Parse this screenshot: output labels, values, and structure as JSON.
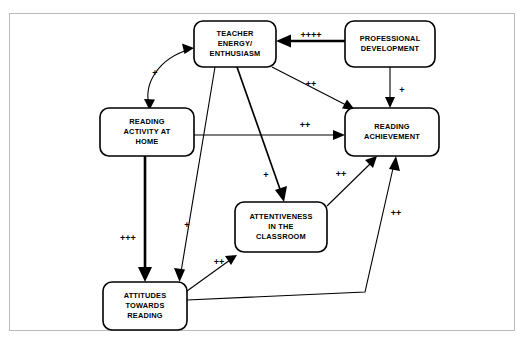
{
  "figure": {
    "clipped_header_fragment": "",
    "nodes": [
      {
        "id": "teacher-energy",
        "lines": [
          "TEACHER",
          "ENERGY/",
          "ENTHUSIASM"
        ],
        "x": 194,
        "y": 21,
        "w": 82,
        "h": 46
      },
      {
        "id": "professional-development",
        "lines": [
          "PROFESSIONAL",
          "DEVELOPMENT"
        ],
        "x": 345,
        "y": 21,
        "w": 90,
        "h": 46
      },
      {
        "id": "reading-activity-at-home",
        "lines": [
          "READING",
          "ACTIVITY AT",
          "HOME"
        ],
        "x": 100,
        "y": 108,
        "w": 94,
        "h": 48
      },
      {
        "id": "reading-achievement",
        "lines": [
          "READING",
          "ACHIEVEMENT"
        ],
        "x": 345,
        "y": 108,
        "w": 94,
        "h": 48
      },
      {
        "id": "attentiveness-in-the-classroom",
        "lines": [
          "ATTENTIVENESS",
          "IN THE",
          "CLASSROOM"
        ],
        "x": 235,
        "y": 202,
        "w": 92,
        "h": 50
      },
      {
        "id": "attitudes-towards-reading",
        "lines": [
          "ATTITUDES",
          "TOWARDS",
          "READING"
        ],
        "x": 103,
        "y": 282,
        "w": 84,
        "h": 48
      }
    ],
    "edges": [
      {
        "id": "professional-development-to-teacher-energy",
        "from": "professional-development",
        "to": "teacher-energy",
        "label": "++++",
        "label_x": 311,
        "label_y": 38,
        "weight": "thick"
      },
      {
        "id": "professional-development-to-reading-achievement",
        "from": "professional-development",
        "to": "reading-achievement",
        "label": "+",
        "label_x": 400,
        "label_y": 93,
        "weight": "normal"
      },
      {
        "id": "teacher-energy-to-reading-activity-at-home",
        "from": "teacher-energy",
        "to": "reading-activity-at-home",
        "label": "+",
        "label_x": 155,
        "label_y": 74,
        "weight": "normal",
        "bidirectional": true
      },
      {
        "id": "teacher-energy-to-reading-achievement",
        "from": "teacher-energy",
        "to": "reading-achievement",
        "label": "++",
        "label_x": 311,
        "label_y": 86,
        "weight": "normal"
      },
      {
        "id": "reading-activity-at-home-to-reading-achievement",
        "from": "reading-activity-at-home",
        "to": "reading-achievement",
        "label": "++",
        "label_x": 305,
        "label_y": 126,
        "weight": "normal"
      },
      {
        "id": "reading-activity-at-home-to-attitudes-towards-reading",
        "from": "reading-activity-at-home",
        "to": "attitudes-towards-reading",
        "label": "+++",
        "label_x": 128,
        "label_y": 238,
        "weight": "thick"
      },
      {
        "id": "teacher-energy-to-attitudes-towards-reading",
        "from": "teacher-energy",
        "to": "attitudes-towards-reading",
        "label": "+",
        "label_x": 185,
        "label_y": 226,
        "weight": "normal"
      },
      {
        "id": "teacher-energy-to-attentiveness",
        "from": "teacher-energy",
        "to": "attentiveness-in-the-classroom",
        "label": "+",
        "label_x": 265,
        "label_y": 178,
        "weight": "medium"
      },
      {
        "id": "attitudes-towards-reading-to-attentiveness",
        "from": "attitudes-towards-reading",
        "to": "attentiveness-in-the-classroom",
        "label": "++",
        "label_x": 219,
        "label_y": 263,
        "weight": "normal"
      },
      {
        "id": "attentiveness-to-reading-achievement",
        "from": "attentiveness-in-the-classroom",
        "to": "reading-achievement",
        "label": "++",
        "label_x": 340,
        "label_y": 176,
        "weight": "normal"
      },
      {
        "id": "attitudes-towards-reading-to-reading-achievement",
        "from": "attitudes-towards-reading",
        "to": "reading-achievement",
        "label": "++",
        "label_x": 394,
        "label_y": 215,
        "weight": "normal"
      }
    ],
    "colors": {
      "stroke": "#000000",
      "box_fill": "#ffffff",
      "frame": "#b9b9b9",
      "background": "#ffffff"
    }
  }
}
